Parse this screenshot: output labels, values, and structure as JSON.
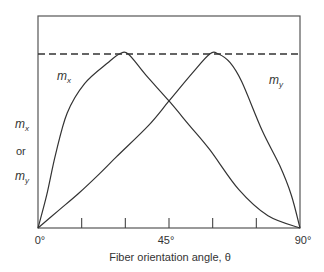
{
  "chart_data": {
    "type": "line",
    "title": "",
    "xlabel": "Fiber orientation angle, θ",
    "ylabel": "m_x or m_y",
    "ylabel_lines": [
      "m",
      "x",
      "or",
      "m",
      "y"
    ],
    "xlim": [
      0,
      90
    ],
    "ylim": [
      0,
      1.22
    ],
    "x_tick_labels": [
      "0°",
      "45°",
      "90°"
    ],
    "x_ticks_unlabeled": [
      15,
      30,
      60,
      75
    ],
    "x_ticks_all": [
      0,
      15,
      30,
      45,
      60,
      75,
      90
    ],
    "grid": false,
    "reference_line": {
      "style": "dashed",
      "y": 1.0,
      "description": "maximum value"
    },
    "series": [
      {
        "name": "m_x",
        "label_position": {
          "x": 8,
          "y": 0.88
        },
        "points": [
          [
            0,
            0
          ],
          [
            3,
            0.19
          ],
          [
            6,
            0.42
          ],
          [
            10,
            0.66
          ],
          [
            16,
            0.83
          ],
          [
            24,
            0.95
          ],
          [
            28,
            1.0
          ],
          [
            31,
            1.0
          ],
          [
            37,
            0.88
          ],
          [
            45,
            0.73
          ],
          [
            52,
            0.59
          ],
          [
            59,
            0.45
          ],
          [
            69,
            0.22
          ],
          [
            79,
            0.07
          ],
          [
            90,
            0
          ]
        ]
      },
      {
        "name": "m_y",
        "label_position": {
          "x": 82,
          "y": 0.85
        },
        "points": [
          [
            0,
            0
          ],
          [
            7,
            0.1
          ],
          [
            14,
            0.2
          ],
          [
            21,
            0.31
          ],
          [
            27,
            0.41
          ],
          [
            38,
            0.59
          ],
          [
            45,
            0.73
          ],
          [
            53,
            0.89
          ],
          [
            59,
            1.0
          ],
          [
            62,
            1.0
          ],
          [
            66,
            0.95
          ],
          [
            70,
            0.84
          ],
          [
            77,
            0.56
          ],
          [
            83,
            0.36
          ],
          [
            87,
            0.19
          ],
          [
            90,
            0
          ]
        ]
      }
    ]
  },
  "labels": {
    "x_axis_title": "Fiber orientation angle, θ",
    "y_axis_or": "or",
    "m": "m",
    "sub_x": "x",
    "sub_y": "y",
    "tick_0": "0°",
    "tick_45": "45°",
    "tick_90": "90°"
  }
}
